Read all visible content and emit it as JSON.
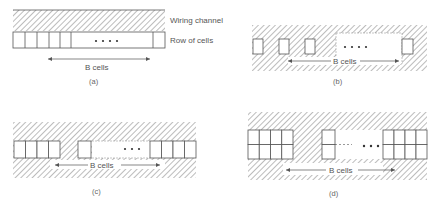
{
  "figure": {
    "legend": {
      "wiring_channel": "Wiring channel",
      "row_of_cells": "Row of cells"
    },
    "panels": [
      {
        "id": "a",
        "caption": "(a)",
        "span_label": "B cells",
        "description": "Single row of cells beneath a wiring channel"
      },
      {
        "id": "b",
        "caption": "(b)",
        "span_label": "B cells",
        "description": "Isolated cells embedded in wiring region"
      },
      {
        "id": "c",
        "caption": "(c)",
        "span_label": "B cells",
        "description": "Groups of 4 cells with B-cell span"
      },
      {
        "id": "d",
        "caption": "(d)",
        "span_label": "B cells",
        "description": "Two-row blocks of cells with B-cell span"
      }
    ],
    "ellipsis": "• • • •",
    "ellipsis3": "• • •",
    "colors": {
      "line": "#555555",
      "hatch": "#777777",
      "background": "#ffffff"
    }
  }
}
